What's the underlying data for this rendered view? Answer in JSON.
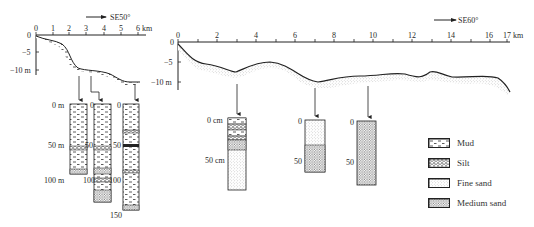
{
  "left_profile": {
    "direction_label": "SE50°",
    "x_ticks": [
      "0",
      "1",
      "2",
      "3",
      "4",
      "5",
      "6 km"
    ],
    "y_ticks": [
      "0",
      "−5",
      "−10 m"
    ],
    "cores": [
      {
        "depth_labels": [
          "0 m",
          "50 m",
          "100 m"
        ]
      },
      {
        "depth_labels": [
          "0",
          "50",
          "100"
        ]
      },
      {
        "depth_labels": [
          "0",
          "50",
          "100",
          "150"
        ]
      }
    ]
  },
  "right_profile": {
    "direction_label": "SE60°",
    "x_ticks": [
      "0",
      "2",
      "4",
      "6",
      "8",
      "10",
      "12",
      "14",
      "16",
      "17 km"
    ],
    "y_ticks": [
      "0",
      "−5",
      "−10 m"
    ],
    "cores": [
      {
        "depth_labels": [
          "0 cm",
          "50 cm"
        ]
      },
      {
        "depth_labels": [
          "0",
          "50"
        ]
      },
      {
        "depth_labels": [
          "0",
          "50"
        ]
      }
    ]
  },
  "legend": {
    "items": [
      {
        "label": "Mud",
        "pattern": "mud"
      },
      {
        "label": "Silt",
        "pattern": "silt"
      },
      {
        "label": "Fine sand",
        "pattern": "fine-sand"
      },
      {
        "label": "Medium sand",
        "pattern": "medium-sand"
      }
    ]
  },
  "colors": {
    "line": "#222222",
    "fill_dots": "#555555",
    "background": "#ffffff"
  }
}
